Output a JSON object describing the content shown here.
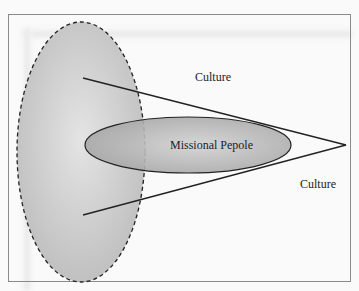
{
  "diagram": {
    "labels": {
      "culture_top": "Culture",
      "center": "Missional Pepole",
      "culture_right": "Culture"
    },
    "colors": {
      "frame": "#8a8a8a",
      "large_ellipse_fill": "#cfcfcf",
      "small_ellipse_fill": "#b8b8b8",
      "stroke": "#222222"
    }
  }
}
